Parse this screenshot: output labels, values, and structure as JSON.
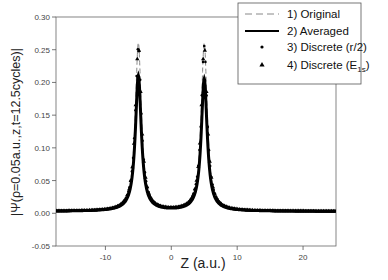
{
  "chart_data": {
    "type": "line",
    "title": "",
    "xlabel": "Z (a.u.)",
    "ylabel": "|Ψ(ρ=0.05a.u.,z,t=12.5cycles)|",
    "xlim": [
      -17.5,
      25
    ],
    "ylim": [
      -0.05,
      0.3
    ],
    "x_ticks": [
      -10,
      0,
      10,
      20
    ],
    "x_tick_labels": [
      "-10",
      "0",
      "10",
      "20"
    ],
    "y_ticks": [
      -0.05,
      0.0,
      0.05,
      0.1,
      0.15,
      0.2,
      0.25,
      0.3
    ],
    "y_tick_labels": [
      "-0.05",
      "0.00",
      "0.05",
      "0.10",
      "0.15",
      "0.20",
      "0.25",
      "0.30"
    ],
    "grid": false,
    "legend_position": "top-right",
    "legend": [
      {
        "label": "1) Original",
        "style": "dashed-line"
      },
      {
        "label": "2) Averaged",
        "style": "solid-line"
      },
      {
        "label": "3) Discrete (r/2)",
        "style": "dot-marker"
      },
      {
        "label": "4) Discrete (E1s)",
        "label_main": "4) Discrete (E",
        "label_sub": "1s",
        "label_end": ")",
        "style": "triangle-marker"
      }
    ],
    "model": {
      "description": "Two symmetric peaks near z = ±5 a.u. with a shallow minimum near z = 0",
      "peak_centers": [
        -5,
        5
      ],
      "peak_heights": [
        0.26,
        0.26
      ],
      "discrete_peak_heights": [
        0.255,
        0.255
      ],
      "averaged_peak_heights": [
        0.21,
        0.205
      ],
      "minimum_at_zero": 0.015,
      "baseline": 0.003
    },
    "series": [
      {
        "name": "1) Original",
        "x": [
          -17.5,
          -15,
          -12,
          -10,
          -8,
          -7,
          -6,
          -5.5,
          -5,
          -4.5,
          -4,
          -3,
          -2,
          -1,
          0,
          1,
          2,
          3,
          4,
          4.5,
          5,
          5.5,
          6,
          7,
          8,
          10,
          12,
          15,
          20,
          25
        ],
        "values": [
          0.002,
          0.002,
          0.003,
          0.005,
          0.012,
          0.025,
          0.07,
          0.15,
          0.26,
          0.16,
          0.09,
          0.045,
          0.025,
          0.018,
          0.015,
          0.018,
          0.025,
          0.045,
          0.09,
          0.16,
          0.26,
          0.15,
          0.07,
          0.025,
          0.012,
          0.005,
          0.003,
          0.002,
          0.001,
          0.001
        ]
      },
      {
        "name": "2) Averaged",
        "x": [
          -17.5,
          -15,
          -12,
          -10,
          -8,
          -7,
          -6,
          -5.5,
          -5,
          -4.5,
          -4,
          -3,
          -2,
          -1,
          0,
          1,
          2,
          3,
          4,
          4.5,
          5,
          5.5,
          6,
          7,
          8,
          10,
          12,
          15,
          20,
          25
        ],
        "values": [
          0.002,
          0.002,
          0.003,
          0.005,
          0.012,
          0.025,
          0.068,
          0.14,
          0.21,
          0.15,
          0.088,
          0.045,
          0.025,
          0.018,
          0.015,
          0.018,
          0.025,
          0.045,
          0.088,
          0.15,
          0.205,
          0.14,
          0.068,
          0.025,
          0.012,
          0.005,
          0.003,
          0.002,
          0.001,
          0.001
        ]
      },
      {
        "name": "3) Discrete (r/2)",
        "x": [
          -17.5,
          -15,
          -12,
          -10,
          -8,
          -7,
          -6,
          -5.5,
          -5,
          -4.5,
          -4,
          -3,
          -2,
          -1,
          0,
          1,
          2,
          3,
          4,
          4.5,
          5,
          5.5,
          6,
          7,
          8,
          10,
          12,
          15,
          20,
          25
        ],
        "values": [
          0.002,
          0.002,
          0.003,
          0.005,
          0.012,
          0.025,
          0.07,
          0.15,
          0.255,
          0.16,
          0.09,
          0.045,
          0.025,
          0.018,
          0.015,
          0.018,
          0.025,
          0.045,
          0.09,
          0.16,
          0.255,
          0.15,
          0.07,
          0.025,
          0.012,
          0.005,
          0.003,
          0.002,
          0.001,
          0.001
        ]
      },
      {
        "name": "4) Discrete (E1s)",
        "x": [
          -17.5,
          -15,
          -12,
          -10,
          -8,
          -7,
          -6,
          -5.5,
          -5,
          -4.5,
          -4,
          -3,
          -2,
          -1,
          0,
          1,
          2,
          3,
          4,
          4.5,
          5,
          5.5,
          6,
          7,
          8,
          10,
          12,
          15,
          20,
          25
        ],
        "values": [
          0.002,
          0.002,
          0.003,
          0.005,
          0.012,
          0.025,
          0.07,
          0.15,
          0.255,
          0.16,
          0.09,
          0.045,
          0.025,
          0.018,
          0.015,
          0.018,
          0.025,
          0.045,
          0.09,
          0.16,
          0.255,
          0.15,
          0.07,
          0.025,
          0.012,
          0.005,
          0.003,
          0.002,
          0.001,
          0.001
        ]
      }
    ]
  }
}
